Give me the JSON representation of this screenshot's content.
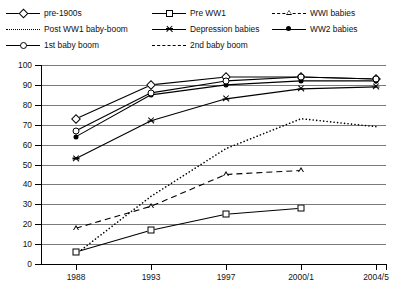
{
  "legend": {
    "position": "top",
    "items": [
      {
        "label": "pre-1900s",
        "marker": "open-diamond",
        "line": "solid",
        "col": 0,
        "row": 0
      },
      {
        "label": "Pre WW1",
        "marker": "open-square",
        "line": "solid",
        "col": 1,
        "row": 0
      },
      {
        "label": "WWI babies",
        "marker": "open-triangle",
        "line": "dashed",
        "col": 2,
        "row": 0
      },
      {
        "label": "Post WW1 baby-boom",
        "marker": "none",
        "line": "dotted",
        "col": 0,
        "row": 1
      },
      {
        "label": "Depression babies",
        "marker": "star",
        "line": "solid",
        "col": 1,
        "row": 1
      },
      {
        "label": "WW2 babies",
        "marker": "filled-circle",
        "line": "solid",
        "col": 2,
        "row": 1
      },
      {
        "label": "1st baby boom",
        "marker": "open-circle",
        "line": "solid",
        "col": 0,
        "row": 2
      },
      {
        "label": "2nd baby boom",
        "marker": "none",
        "line": "dashed",
        "col": 1,
        "row": 2
      }
    ]
  },
  "axes": {
    "y_ticks": [
      100,
      90,
      80,
      70,
      60,
      50,
      40,
      30,
      20,
      10,
      0
    ],
    "x_ticks": [
      "1988",
      "1993",
      "1997",
      "2000/1",
      "2004/5"
    ],
    "ylim": [
      0,
      100
    ],
    "grid": "horizontal",
    "title": "",
    "xlabel": "",
    "ylabel": ""
  },
  "chart_data": {
    "type": "line",
    "title": "",
    "subtitle": "",
    "xlabel": "",
    "ylabel": "",
    "x": [
      "1988",
      "1993",
      "1997",
      "2000/1",
      "2004/5"
    ],
    "ylim": [
      0,
      100
    ],
    "xlim": [
      0,
      4
    ],
    "grid": true,
    "legend_position": "top",
    "annotations": [],
    "series": [
      {
        "name": "pre-1900s",
        "marker": "open-diamond",
        "line": "solid",
        "color": "#000000",
        "values": [
          73,
          90,
          94,
          94,
          93
        ]
      },
      {
        "name": "Pre WW1",
        "marker": "open-square",
        "line": "solid",
        "color": "#000000",
        "values": [
          6,
          17,
          25,
          28,
          null
        ]
      },
      {
        "name": "WWI babies",
        "marker": "open-triangle",
        "line": "dashed",
        "color": "#000000",
        "values": [
          18,
          29,
          45,
          47,
          null
        ]
      },
      {
        "name": "Post WW1 baby-boom",
        "marker": "none",
        "line": "dotted",
        "color": "#000000",
        "values": [
          5,
          34,
          58,
          73,
          69
        ]
      },
      {
        "name": "Depression babies",
        "marker": "star",
        "line": "solid",
        "color": "#000000",
        "values": [
          53,
          72,
          83,
          88,
          89
        ]
      },
      {
        "name": "WW2 babies",
        "marker": "filled-circle",
        "line": "solid",
        "color": "#000000",
        "values": [
          64,
          85,
          90,
          92,
          92
        ]
      },
      {
        "name": "1st baby boom",
        "marker": "open-circle",
        "line": "solid",
        "color": "#000000",
        "values": [
          67,
          86,
          92,
          94,
          93
        ]
      }
    ]
  }
}
